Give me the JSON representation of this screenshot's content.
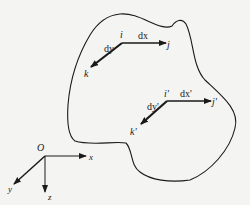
{
  "diagram": {
    "body_outline": "deformable body (closed curve)",
    "before": {
      "i": "i",
      "j": "j",
      "k": "k",
      "dx": "dx",
      "dy": "dy"
    },
    "after": {
      "i": "i'",
      "j": "j'",
      "k": "k'",
      "dx": "dx'",
      "dy": "dy'"
    },
    "axes": {
      "origin": "O",
      "x": "x",
      "y": "y",
      "z": "z"
    },
    "colors": {
      "line": "#1a1a1a",
      "background": "#f4f4f2"
    }
  }
}
